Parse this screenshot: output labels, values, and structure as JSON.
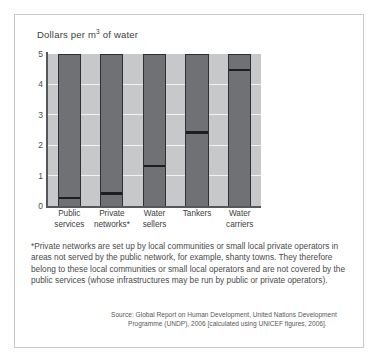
{
  "figure": {
    "title_prefix": "Dollars per m",
    "title_exponent": "3",
    "title_suffix": " of water"
  },
  "chart_data": {
    "type": "bar",
    "title": "Dollars per m3 of water",
    "xlabel": "",
    "ylabel": "Dollars per m3 of water",
    "ylim": [
      0,
      5
    ],
    "yticks": [
      "0",
      "1",
      "2",
      "3",
      "4",
      "5"
    ],
    "grid": true,
    "legend": "none",
    "note": "Each category is drawn as a full-height column with a black horizontal marker line indicating the price value.",
    "categories": [
      "Public services",
      "Private networks*",
      "Water sellers",
      "Tankers",
      "Water carriers"
    ],
    "category_lines": [
      [
        "Public",
        "services"
      ],
      [
        "Private",
        "networks*"
      ],
      [
        "Water",
        "sellers"
      ],
      [
        "Tankers",
        ""
      ],
      [
        "Water",
        "carriers"
      ]
    ],
    "values": [
      0.3,
      0.45,
      1.35,
      2.45,
      4.5
    ],
    "colors": {
      "bar_fill": "#6f7174",
      "bar_outline": "#2f3032",
      "marker": "#1d1e20",
      "plot_background": "#c7c8c9",
      "gridline": "#f2f2f2",
      "axis": "#55575a",
      "border": "#c9c9c9"
    }
  },
  "footnote": {
    "text": "*Private networks are set up by local communities or small local private operators in areas not served by the public network, for example, shanty towns. They therefore belong to these local communities or small local operators and are not covered by the public services (whose infrastructures may be run by public or private operators)."
  },
  "source": {
    "line1": "Source: Global Report on Human Development, United Nations Development",
    "line2": "Programme (UNDP), 2006 [calculated using UNICEF figures, 2006]."
  }
}
